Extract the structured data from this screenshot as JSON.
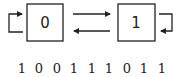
{
  "diagram": {
    "states": [
      {
        "id": "state-0",
        "label": "0"
      },
      {
        "id": "state-1",
        "label": "1"
      }
    ],
    "transitions": [
      {
        "from": "0",
        "to": "0",
        "kind": "self-loop"
      },
      {
        "from": "0",
        "to": "1",
        "kind": "forward"
      },
      {
        "from": "1",
        "to": "0",
        "kind": "backward"
      },
      {
        "from": "1",
        "to": "1",
        "kind": "self-loop"
      }
    ],
    "sequence": [
      "1",
      "0",
      "0",
      "1",
      "1",
      "1",
      "0",
      "1",
      "1"
    ],
    "colors": {
      "stroke": "#222222",
      "background": "#ffffff"
    }
  }
}
